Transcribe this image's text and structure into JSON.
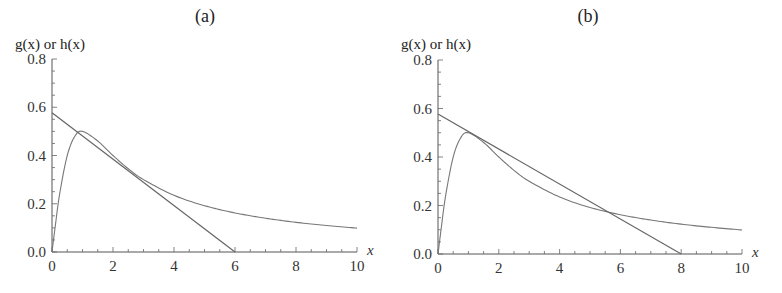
{
  "chart_data": [
    {
      "type": "line",
      "title": "(a)",
      "xlabel": "x",
      "ylabel": "g(x) or h(x)",
      "xlim": [
        0,
        10
      ],
      "ylim": [
        0,
        0.8
      ],
      "xticks": [
        "0",
        "2",
        "4",
        "6",
        "8",
        "10"
      ],
      "yticks": [
        "0.0",
        "0.2",
        "0.4",
        "0.6",
        "0.8"
      ],
      "grid": false,
      "series": [
        {
          "name": "g(x)",
          "style": "curve",
          "x": [
            0,
            0.1,
            0.25,
            0.5,
            0.75,
            1,
            1.5,
            2,
            2.5,
            3,
            4,
            5,
            6,
            7,
            8,
            9,
            10
          ],
          "y": [
            0,
            0.1,
            0.24,
            0.4,
            0.48,
            0.5,
            0.46,
            0.4,
            0.345,
            0.3,
            0.235,
            0.192,
            0.162,
            0.14,
            0.123,
            0.11,
            0.099
          ]
        },
        {
          "name": "h(x)",
          "style": "line",
          "x": [
            0,
            6
          ],
          "y": [
            0.577,
            0
          ]
        }
      ]
    },
    {
      "type": "line",
      "title": "(b)",
      "xlabel": "x",
      "ylabel": "g(x) or h(x)",
      "xlim": [
        0,
        10
      ],
      "ylim": [
        0,
        0.8
      ],
      "xticks": [
        "0",
        "2",
        "4",
        "6",
        "8",
        "10"
      ],
      "yticks": [
        "0.0",
        "0.2",
        "0.4",
        "0.6",
        "0.8"
      ],
      "grid": false,
      "series": [
        {
          "name": "g(x)",
          "style": "curve",
          "x": [
            0,
            0.1,
            0.25,
            0.5,
            0.75,
            1,
            1.5,
            2,
            2.5,
            3,
            4,
            5,
            6,
            7,
            8,
            9,
            10
          ],
          "y": [
            0,
            0.1,
            0.24,
            0.4,
            0.48,
            0.5,
            0.46,
            0.4,
            0.345,
            0.3,
            0.235,
            0.192,
            0.162,
            0.14,
            0.123,
            0.11,
            0.099
          ]
        },
        {
          "name": "h(x)",
          "style": "line",
          "x": [
            0,
            8
          ],
          "y": [
            0.577,
            0
          ]
        }
      ]
    }
  ]
}
